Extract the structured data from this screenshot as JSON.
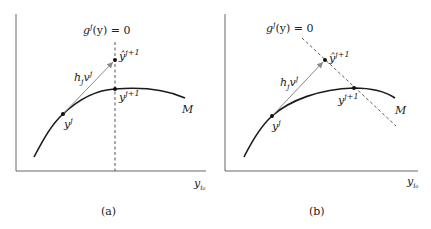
{
  "panels": [
    {
      "id": "a",
      "caption": "(a)",
      "constraint_label": "g",
      "constraint_sup": "j",
      "constraint_rest": "(y) = 0",
      "predictor_label": "ŷ",
      "predictor_sup": "j+1",
      "corrector_label": "y",
      "corrector_sup": "j+1",
      "start_label": "y",
      "start_sup": "j",
      "step_label": "h",
      "step_sub": "j",
      "step_vec": "v",
      "step_vec_sup": "j",
      "manifold_label": "M",
      "axis_label": "y",
      "axis_sub": "i₀"
    },
    {
      "id": "b",
      "caption": "(b)",
      "constraint_label": "g",
      "constraint_sup": "j",
      "constraint_rest": "(y) = 0",
      "predictor_label": "ŷ",
      "predictor_sup": "j+1",
      "corrector_label": "y",
      "corrector_sup": "j+1",
      "start_label": "y",
      "start_sup": "j",
      "step_label": "h",
      "step_sub": "j",
      "step_vec": "v",
      "step_vec_sup": "j",
      "manifold_label": "M",
      "axis_label": "y",
      "axis_sub": "i₀"
    }
  ],
  "colors": {
    "axis": "#555555",
    "curve": "#1a1a1a",
    "arrow": "#777777",
    "dashed": "#444444",
    "point": "#111111"
  }
}
